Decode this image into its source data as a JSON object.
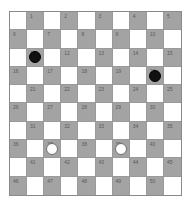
{
  "board": {
    "size": 10,
    "colors": {
      "light_square": "#ffffff",
      "dark_square": "#a3a3a3",
      "number_text": "#5a5a5a",
      "black_piece": "#111111",
      "white_piece": "#ffffff",
      "white_piece_outline": "#6e6e6e"
    },
    "rows": [
      {
        "squares": [
          {
            "dark": false
          },
          {
            "dark": true,
            "num": "1"
          },
          {
            "dark": false
          },
          {
            "dark": true,
            "num": "2"
          },
          {
            "dark": false
          },
          {
            "dark": true,
            "num": "3"
          },
          {
            "dark": false
          },
          {
            "dark": true,
            "num": "4"
          },
          {
            "dark": false
          },
          {
            "dark": true,
            "num": "5"
          }
        ]
      },
      {
        "squares": [
          {
            "dark": true,
            "num": "6"
          },
          {
            "dark": false
          },
          {
            "dark": true,
            "num": "7"
          },
          {
            "dark": false
          },
          {
            "dark": true,
            "num": "8"
          },
          {
            "dark": false
          },
          {
            "dark": true,
            "num": "9"
          },
          {
            "dark": false
          },
          {
            "dark": true,
            "num": "10"
          },
          {
            "dark": false
          }
        ]
      },
      {
        "squares": [
          {
            "dark": false
          },
          {
            "dark": true,
            "num": "11",
            "piece": "black"
          },
          {
            "dark": false
          },
          {
            "dark": true,
            "num": "12"
          },
          {
            "dark": false
          },
          {
            "dark": true,
            "num": "13"
          },
          {
            "dark": false
          },
          {
            "dark": true,
            "num": "14"
          },
          {
            "dark": false
          },
          {
            "dark": true,
            "num": "15"
          }
        ]
      },
      {
        "squares": [
          {
            "dark": true,
            "num": "16"
          },
          {
            "dark": false
          },
          {
            "dark": true,
            "num": "17"
          },
          {
            "dark": false
          },
          {
            "dark": true,
            "num": "18"
          },
          {
            "dark": false
          },
          {
            "dark": true,
            "num": "19"
          },
          {
            "dark": false
          },
          {
            "dark": true,
            "num": "20",
            "piece": "black"
          },
          {
            "dark": false
          }
        ]
      },
      {
        "squares": [
          {
            "dark": false
          },
          {
            "dark": true,
            "num": "21"
          },
          {
            "dark": false
          },
          {
            "dark": true,
            "num": "22"
          },
          {
            "dark": false
          },
          {
            "dark": true,
            "num": "23"
          },
          {
            "dark": false
          },
          {
            "dark": true,
            "num": "24"
          },
          {
            "dark": false
          },
          {
            "dark": true,
            "num": "25"
          }
        ]
      },
      {
        "squares": [
          {
            "dark": true,
            "num": "26"
          },
          {
            "dark": false
          },
          {
            "dark": true,
            "num": "27"
          },
          {
            "dark": false
          },
          {
            "dark": true,
            "num": "28"
          },
          {
            "dark": false
          },
          {
            "dark": true,
            "num": "29"
          },
          {
            "dark": false
          },
          {
            "dark": true,
            "num": "30"
          },
          {
            "dark": false
          }
        ]
      },
      {
        "squares": [
          {
            "dark": false
          },
          {
            "dark": true,
            "num": "31"
          },
          {
            "dark": false
          },
          {
            "dark": true,
            "num": "32"
          },
          {
            "dark": false
          },
          {
            "dark": true,
            "num": "33"
          },
          {
            "dark": false
          },
          {
            "dark": true,
            "num": "34"
          },
          {
            "dark": false
          },
          {
            "dark": true,
            "num": "35"
          }
        ]
      },
      {
        "squares": [
          {
            "dark": true,
            "num": "36"
          },
          {
            "dark": false
          },
          {
            "dark": true,
            "num": "37",
            "piece": "white"
          },
          {
            "dark": false
          },
          {
            "dark": true,
            "num": "38"
          },
          {
            "dark": false
          },
          {
            "dark": true,
            "num": "39",
            "piece": "white"
          },
          {
            "dark": false
          },
          {
            "dark": true,
            "num": "40"
          },
          {
            "dark": false
          }
        ]
      },
      {
        "squares": [
          {
            "dark": false
          },
          {
            "dark": true,
            "num": "41"
          },
          {
            "dark": false
          },
          {
            "dark": true,
            "num": "42"
          },
          {
            "dark": false
          },
          {
            "dark": true,
            "num": "43"
          },
          {
            "dark": false
          },
          {
            "dark": true,
            "num": "44"
          },
          {
            "dark": false
          },
          {
            "dark": true,
            "num": "45"
          }
        ]
      },
      {
        "squares": [
          {
            "dark": true,
            "num": "46"
          },
          {
            "dark": false
          },
          {
            "dark": true,
            "num": "47"
          },
          {
            "dark": false
          },
          {
            "dark": true,
            "num": "48"
          },
          {
            "dark": false
          },
          {
            "dark": true,
            "num": "49"
          },
          {
            "dark": false
          },
          {
            "dark": true,
            "num": "50"
          },
          {
            "dark": false
          }
        ]
      }
    ]
  },
  "pieces": [
    {
      "square": "11",
      "color": "black"
    },
    {
      "square": "20",
      "color": "black"
    },
    {
      "square": "37",
      "color": "white"
    },
    {
      "square": "39",
      "color": "white"
    }
  ]
}
